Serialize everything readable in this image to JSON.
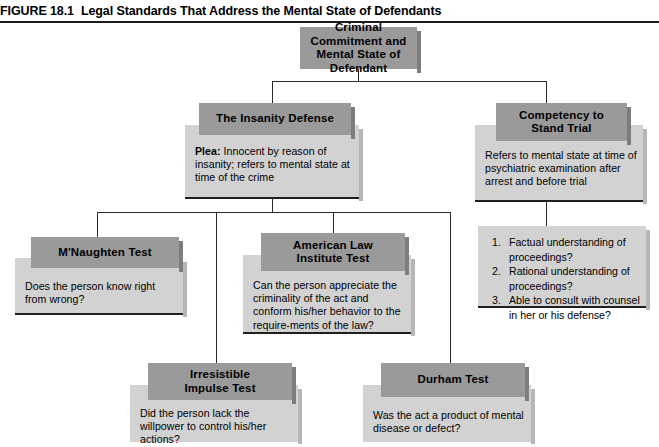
{
  "figure": {
    "number": "FIGURE 18.1",
    "title": "Legal Standards That Address the Mental State of Defendants"
  },
  "nodes": {
    "root": {
      "title_line1": "Criminal Commitment and",
      "title_line2": "Mental State of Defendant"
    },
    "insanity": {
      "title": "The Insanity Defense",
      "plea_label": "Plea:",
      "body": " Innocent by reason of insanity; refers to mental state at time of the crime"
    },
    "competency": {
      "title_line1": "Competency to",
      "title_line2": "Stand Trial",
      "body": "Refers to mental state at time of psychiatric examination after arrest and before trial"
    },
    "competency_criteria": {
      "items": [
        {
          "num": "1.",
          "text": "Factual understanding of proceedings?"
        },
        {
          "num": "2.",
          "text": "Rational understanding of proceedings?"
        },
        {
          "num": "3.",
          "text": "Able to consult with counsel in her or his defense?"
        }
      ]
    },
    "mnaughten": {
      "title": "M'Naughten Test",
      "body": "Does the person know right from wrong?"
    },
    "ali": {
      "title_line1": "American Law",
      "title_line2": "Institute Test",
      "body": "Can the person appreciate the criminality of the act and conform his/her behavior to the require-ments of the law?"
    },
    "irresistible": {
      "title_line1": "Irresistible",
      "title_line2": "Impulse Test",
      "body": "Did the person lack the willpower to control his/her actions?"
    },
    "durham": {
      "title": "Durham Test",
      "body": "Was the act a product of mental disease or defect?"
    }
  },
  "colors": {
    "header_fill": "#9a9a9a",
    "body_fill": "#d2d2d2",
    "rule": "#1f1f1f",
    "connector": "#2a2a2a",
    "page": "#ffffff"
  }
}
